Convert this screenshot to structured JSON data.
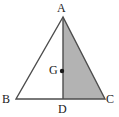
{
  "figure": {
    "name": "triangle-with-median-and-centroid",
    "background_color": "#ffffff",
    "stroke_color": "#4d4d4d",
    "shaded_region_color": "#b3b3b3",
    "point_color": "#1a1a1a",
    "labels": {
      "apex": "A",
      "bottom_left": "B",
      "bottom_right": "C",
      "base_midpoint": "D",
      "centroid": "G"
    },
    "points": {
      "A": {
        "x": 63,
        "y": 17
      },
      "B": {
        "x": 16,
        "y": 99
      },
      "C": {
        "x": 105,
        "y": 99
      },
      "D": {
        "x": 63,
        "y": 99
      },
      "G": {
        "x": 62,
        "y": 71
      }
    },
    "shaded_polygon": "A-D-C",
    "segments": [
      "A-B",
      "B-C",
      "C-A",
      "A-D"
    ]
  }
}
